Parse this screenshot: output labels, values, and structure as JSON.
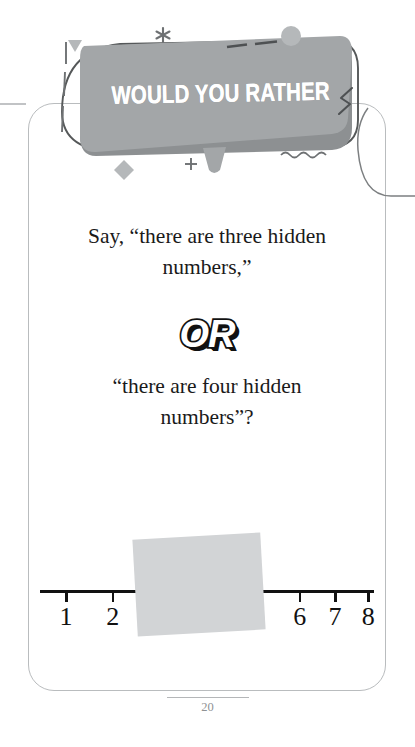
{
  "card": {
    "banner": {
      "title": "WOULD YOU RATHER"
    },
    "prompt_first": "Say, “there are three hidden numbers,”",
    "or_label": "OR",
    "prompt_second": "“there are four hidden numbers”?",
    "number_line": {
      "visible_labels": [
        "1",
        "2",
        "6",
        "7",
        "8"
      ],
      "hidden_count_option_a": "three",
      "hidden_count_option_b": "four",
      "ticks": [
        {
          "label": "1",
          "x_pct": 7.5,
          "hidden": false
        },
        {
          "label": "2",
          "x_pct": 21.5,
          "hidden": false
        },
        {
          "label": "3",
          "x_pct": 35.5,
          "hidden": true
        },
        {
          "label": "4",
          "x_pct": 49.5,
          "hidden": true
        },
        {
          "label": "5",
          "x_pct": 63.5,
          "hidden": true
        },
        {
          "label": "6",
          "x_pct": 77.5,
          "hidden": false
        },
        {
          "label": "7",
          "x_pct": 88.0,
          "hidden": false
        },
        {
          "label": "8",
          "x_pct": 98.0,
          "hidden": false
        }
      ]
    }
  },
  "footer": {
    "page_number": "20"
  },
  "colors": {
    "banner_fill": "#a3a6a8",
    "banner_shadow": "#8d9092",
    "banner_text": "#ffffff",
    "sticky_note": "#d2d4d6",
    "card_border": "#b9bcbe",
    "ink": "#111111",
    "decor_gray": "#b5b8ba",
    "decor_dark": "#6e7173",
    "page_number": "#8f9294",
    "background": "#ffffff"
  }
}
